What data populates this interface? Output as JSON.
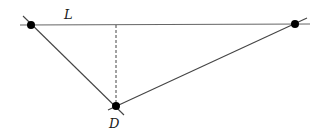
{
  "diagram": {
    "labels": {
      "line": "L",
      "point": "D"
    },
    "colors": {
      "line": "#555555",
      "point": "#000000",
      "label": "#1a1a1a"
    },
    "points": {
      "left": {
        "x": 31,
        "y": 25
      },
      "right": {
        "x": 295,
        "y": 24
      },
      "bottom": {
        "x": 116,
        "y": 106
      }
    },
    "perpendicular_foot": {
      "x": 116,
      "y": 25
    },
    "line_style": {
      "top": "solid",
      "perpendicular": "dashed"
    }
  }
}
